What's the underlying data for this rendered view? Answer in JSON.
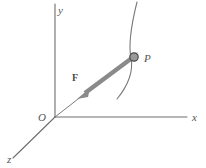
{
  "figure": {
    "background_color": "#ffffff",
    "axis_color": "#6e6e6e",
    "curve_color": "#7a7a7a",
    "vector_color": "#8a8a8a",
    "marker_fill": "#9a9a9a",
    "marker_stroke": "#4a4a4a",
    "label_color": "#555555"
  },
  "axes": [
    {
      "id": "y-axis",
      "label": "y",
      "label_x": 58,
      "label_y": 14,
      "from": {
        "x": 55,
        "y": 117
      },
      "to": {
        "x": 55,
        "y": 4
      }
    },
    {
      "id": "x-axis",
      "label": "x",
      "label_x": 192,
      "label_y": 121,
      "from": {
        "x": 55,
        "y": 117
      },
      "to": {
        "x": 187,
        "y": 117
      }
    },
    {
      "id": "z-axis",
      "label": "z",
      "label_x": 7,
      "label_y": 163,
      "from": {
        "x": 55,
        "y": 117
      },
      "to": {
        "x": 13,
        "y": 158
      }
    }
  ],
  "origin": {
    "label": "O",
    "label_x": 40,
    "label_y": 121,
    "x": 55,
    "y": 117
  },
  "point": {
    "label": "P",
    "label_x": 144,
    "label_y": 62,
    "x": 134,
    "y": 57,
    "marker_radius": 4.2
  },
  "vector": {
    "label": "F",
    "label_x": 74,
    "label_y": 80,
    "tail": {
      "x": 132,
      "y": 58
    },
    "tip": {
      "x": 77,
      "y": 99
    },
    "width": 4.4
  },
  "curve": {
    "id": "trajectory-curve",
    "path": "M 137 2 C 131 26 128 44 131 58 C 134 74 126 88 117 99"
  },
  "guide_ray": {
    "id": "origin-to-point-ray",
    "from": {
      "x": 55,
      "y": 117
    },
    "to": {
      "x": 137,
      "y": 53
    }
  }
}
